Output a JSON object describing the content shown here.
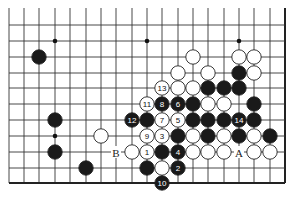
{
  "diagram": {
    "type": "go-board-fragment",
    "grid": {
      "columns_x": [
        9,
        24,
        39,
        55,
        70,
        86,
        101,
        116,
        132,
        147,
        162,
        178,
        193,
        208,
        224,
        239,
        254,
        270,
        285
      ],
      "rows_y": [
        25,
        41,
        57,
        73,
        88,
        104,
        120,
        136,
        152,
        168,
        183
      ],
      "top_extend_y": 8,
      "right_edge": true,
      "bottom_edge": true,
      "left_edge": false,
      "line_color": "#333333",
      "edge_color": "#222222"
    },
    "star_points": [
      {
        "c": 3,
        "r": 1
      },
      {
        "c": 9,
        "r": 1
      },
      {
        "c": 15,
        "r": 1
      },
      {
        "c": 3,
        "r": 7
      }
    ],
    "stones": [
      {
        "c": 2,
        "r": 2,
        "color": "black",
        "label": ""
      },
      {
        "c": 12,
        "r": 2,
        "color": "white",
        "label": ""
      },
      {
        "c": 15,
        "r": 2,
        "color": "white",
        "label": ""
      },
      {
        "c": 16,
        "r": 2,
        "color": "white",
        "label": ""
      },
      {
        "c": 11,
        "r": 3,
        "color": "white",
        "label": ""
      },
      {
        "c": 13,
        "r": 3,
        "color": "white",
        "label": ""
      },
      {
        "c": 15,
        "r": 3,
        "color": "black",
        "label": ""
      },
      {
        "c": 16,
        "r": 3,
        "color": "white",
        "label": ""
      },
      {
        "c": 10,
        "r": 4,
        "color": "white",
        "label": "13"
      },
      {
        "c": 11,
        "r": 4,
        "color": "white",
        "label": ""
      },
      {
        "c": 12,
        "r": 4,
        "color": "white",
        "label": ""
      },
      {
        "c": 13,
        "r": 4,
        "color": "black",
        "label": ""
      },
      {
        "c": 14,
        "r": 4,
        "color": "black",
        "label": ""
      },
      {
        "c": 15,
        "r": 4,
        "color": "black",
        "label": ""
      },
      {
        "c": 9,
        "r": 5,
        "color": "white",
        "label": "11"
      },
      {
        "c": 10,
        "r": 5,
        "color": "black",
        "label": "8"
      },
      {
        "c": 11,
        "r": 5,
        "color": "black",
        "label": "6"
      },
      {
        "c": 12,
        "r": 5,
        "color": "black",
        "label": ""
      },
      {
        "c": 13,
        "r": 5,
        "color": "white",
        "label": ""
      },
      {
        "c": 14,
        "r": 5,
        "color": "white",
        "label": ""
      },
      {
        "c": 16,
        "r": 5,
        "color": "black",
        "label": ""
      },
      {
        "c": 3,
        "r": 6,
        "color": "black",
        "label": ""
      },
      {
        "c": 8,
        "r": 6,
        "color": "black",
        "label": "12"
      },
      {
        "c": 9,
        "r": 6,
        "color": "black",
        "label": ""
      },
      {
        "c": 10,
        "r": 6,
        "color": "white",
        "label": "7"
      },
      {
        "c": 11,
        "r": 6,
        "color": "white",
        "label": "5"
      },
      {
        "c": 12,
        "r": 6,
        "color": "black",
        "label": ""
      },
      {
        "c": 13,
        "r": 6,
        "color": "black",
        "label": ""
      },
      {
        "c": 14,
        "r": 6,
        "color": "black",
        "label": ""
      },
      {
        "c": 15,
        "r": 6,
        "color": "black",
        "label": "14"
      },
      {
        "c": 16,
        "r": 6,
        "color": "black",
        "label": ""
      },
      {
        "c": 6,
        "r": 7,
        "color": "white",
        "label": ""
      },
      {
        "c": 9,
        "r": 7,
        "color": "white",
        "label": "9"
      },
      {
        "c": 10,
        "r": 7,
        "color": "white",
        "label": "3"
      },
      {
        "c": 11,
        "r": 7,
        "color": "black",
        "label": ""
      },
      {
        "c": 12,
        "r": 7,
        "color": "white",
        "label": ""
      },
      {
        "c": 13,
        "r": 7,
        "color": "black",
        "label": ""
      },
      {
        "c": 14,
        "r": 7,
        "color": "white",
        "label": ""
      },
      {
        "c": 15,
        "r": 7,
        "color": "black",
        "label": ""
      },
      {
        "c": 16,
        "r": 7,
        "color": "white",
        "label": ""
      },
      {
        "c": 17,
        "r": 7,
        "color": "black",
        "label": ""
      },
      {
        "c": 3,
        "r": 8,
        "color": "black",
        "label": ""
      },
      {
        "c": 8,
        "r": 8,
        "color": "white",
        "label": ""
      },
      {
        "c": 9,
        "r": 8,
        "color": "white",
        "label": "1"
      },
      {
        "c": 10,
        "r": 8,
        "color": "black",
        "label": ""
      },
      {
        "c": 11,
        "r": 8,
        "color": "black",
        "label": "4"
      },
      {
        "c": 12,
        "r": 8,
        "color": "white",
        "label": ""
      },
      {
        "c": 13,
        "r": 8,
        "color": "white",
        "label": ""
      },
      {
        "c": 14,
        "r": 8,
        "color": "white",
        "label": ""
      },
      {
        "c": 16,
        "r": 8,
        "color": "white",
        "label": ""
      },
      {
        "c": 17,
        "r": 8,
        "color": "white",
        "label": ""
      },
      {
        "c": 5,
        "r": 9,
        "color": "black",
        "label": ""
      },
      {
        "c": 9,
        "r": 9,
        "color": "black",
        "label": ""
      },
      {
        "c": 10,
        "r": 9,
        "color": "white",
        "label": ""
      },
      {
        "c": 11,
        "r": 9,
        "color": "black",
        "label": "2"
      },
      {
        "c": 10,
        "r": 10,
        "color": "black",
        "label": "10"
      }
    ],
    "markers": [
      {
        "c": 7,
        "r": 8,
        "label": "B"
      },
      {
        "c": 15,
        "r": 8,
        "label": "A"
      }
    ],
    "colors": {
      "black_stone": "#1a1a1a",
      "white_stone": "#ffffff",
      "stone_outline": "#222222",
      "background": "#ffffff"
    },
    "stone_radius": 7.2
  }
}
